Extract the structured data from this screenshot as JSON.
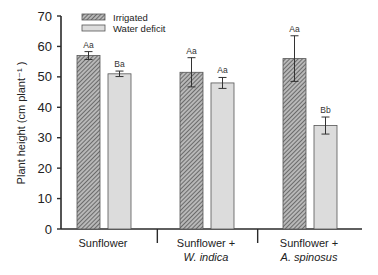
{
  "chart_data": {
    "type": "bar",
    "title": "",
    "xlabel": "",
    "ylabel": "Plant  height (cm plant⁻¹ )",
    "ylim": [
      0,
      70
    ],
    "yticks": [
      0,
      10,
      20,
      30,
      40,
      50,
      60,
      70
    ],
    "grid": false,
    "legend_position": "top-left inside",
    "categories": [
      {
        "line1": "Sunflower",
        "line2": "",
        "italic2": false
      },
      {
        "line1": "Sunflower +",
        "line2": "W. indica",
        "italic2": true
      },
      {
        "line1": "Sunflower +",
        "line2": "A. spinosus",
        "italic2": true
      }
    ],
    "series": [
      {
        "name": "Irrigated",
        "pattern": "hatched",
        "values": [
          57,
          51.5,
          56
        ],
        "errors": [
          1.3,
          4.8,
          7.5
        ],
        "significance": [
          "Aa",
          "Aa",
          "Aa"
        ]
      },
      {
        "name": "Water deficit",
        "pattern": "light-gray",
        "values": [
          51,
          48,
          34
        ],
        "errors": [
          0.9,
          1.8,
          2.8
        ],
        "significance": [
          "Ba",
          "Aa",
          "Bb"
        ]
      }
    ]
  },
  "colors": {
    "axis": "#2a2a2a",
    "irrigated_fill": "#8a8a8a",
    "water_deficit_fill": "#dcdcdc",
    "bar_stroke": "#555555"
  }
}
